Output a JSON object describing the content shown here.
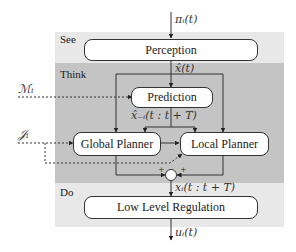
{
  "colors": {
    "see_band": "#e8e8e8",
    "think_band": "#c4c4c4",
    "do_band": "#e8e8e8",
    "box_fill": "#ffffff",
    "stroke": "#333333"
  },
  "bands": [
    {
      "id": "see",
      "label": "See"
    },
    {
      "id": "think",
      "label": "Think"
    },
    {
      "id": "do",
      "label": "Do"
    }
  ],
  "blocks": {
    "perception": "Perception",
    "prediction": "Prediction",
    "global_planner": "Global Planner",
    "local_planner": "Local Planner",
    "low_level_regulation": "Low Level Regulation"
  },
  "signals": {
    "input_top": "πᵢ(t)",
    "state_estimate": "x̂(t)",
    "prediction_output": "x̂₋ᵢ(t : t + T)",
    "map_input": "ℳᵢ",
    "objective_input": "𝒥ᵢ",
    "trajectory": "xᵢ(t : t + T)",
    "control_output": "uᵢ(t)"
  },
  "summing_junction": {
    "left_sign": "+",
    "right_sign": "+"
  }
}
